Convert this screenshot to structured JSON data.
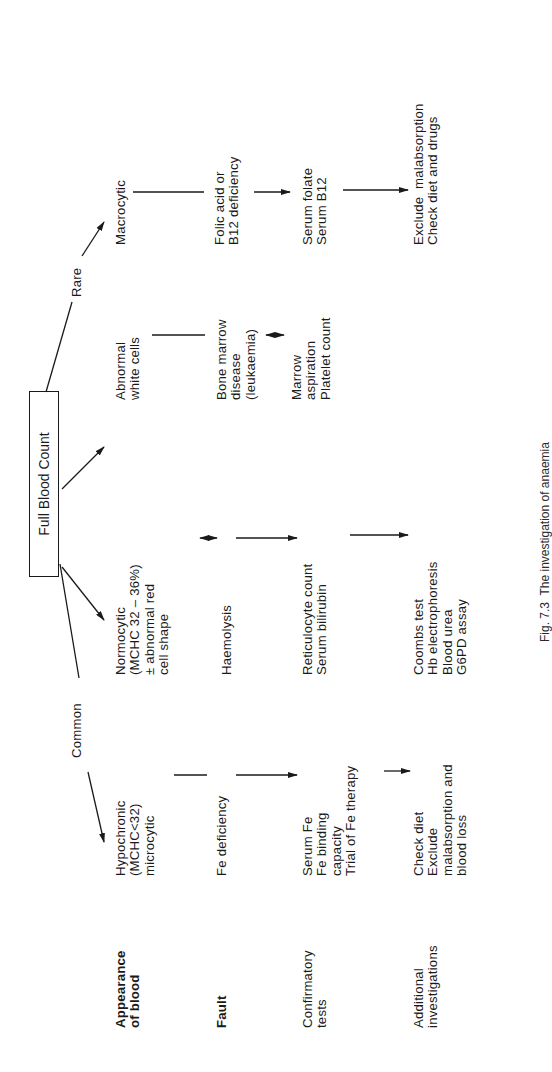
{
  "root": {
    "label": "Full Blood Count"
  },
  "branches": {
    "common": "Common",
    "rare": "Rare"
  },
  "row_labels": [
    {
      "lines": [
        "Appearance",
        "of blood"
      ]
    },
    {
      "lines": [
        "Fault"
      ]
    },
    {
      "lines": [
        "Confirmatory",
        "tests"
      ]
    },
    {
      "lines": [
        "Additional",
        "investigations"
      ]
    }
  ],
  "columns": [
    {
      "appearance": [
        "Hypochronic",
        "(MCHC<32)",
        "microcytic"
      ],
      "fault": [
        "Fe deficiency"
      ],
      "confirmatory": [
        "Serum Fe",
        "Fe binding",
        "capacity",
        "Trial of Fe therapy"
      ],
      "additional": [
        "Check diet",
        "Exclude",
        "malabsorption and",
        "blood loss"
      ]
    },
    {
      "appearance": [
        "Normocytic",
        "(MCHC 32 – 36%)",
        "± abnormal red",
        "cell shape"
      ],
      "fault": [
        "Haemolysis"
      ],
      "confirmatory": [
        "Reticulocyte count",
        "Serum bilirubin"
      ],
      "additional": [
        "Coombs test",
        "Hb electrophoresis",
        "Blood urea",
        "G6PD assay"
      ]
    },
    {
      "appearance": [
        "Abnormal",
        "white cells"
      ],
      "fault": [
        "Bone marrow",
        "disease",
        "(leukaemia)"
      ],
      "confirmatory": [
        "Marrow",
        "aspiration",
        "Platelet count"
      ],
      "additional": []
    },
    {
      "appearance": [
        "Macrocytic"
      ],
      "fault": [
        "Folic acid or",
        "B12 deficiency"
      ],
      "confirmatory": [
        "Serum folate",
        "Serum B12"
      ],
      "additional": [
        "Exclude  malabsorption",
        "Check diet and drugs"
      ]
    }
  ],
  "caption": "Fig. 7.3  The investigation of anaemia"
}
